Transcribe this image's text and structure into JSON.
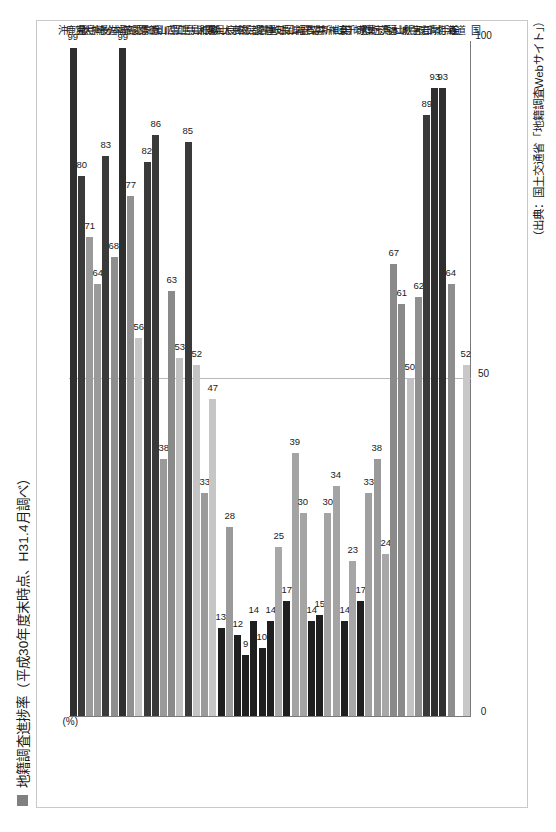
{
  "document": {
    "title": "地籍調査進捗率（平成30年度末時点、H31.4月調べ）",
    "legend_swatch_color": "#808080",
    "source_note": "（出典：国土交通省「地籍調査Webサイト」）"
  },
  "chart_data": {
    "type": "bar",
    "orientation": "horizontal",
    "title": "地籍調査進捗率（平成30年度末時点、H31.4月調べ）",
    "xlabel": "",
    "ylabel": "(%)",
    "unit_label": "(%)",
    "xlim": [
      0,
      100
    ],
    "ticks": [
      "0",
      "50",
      "100"
    ],
    "tick_values": [
      0,
      50,
      100
    ],
    "grid": true,
    "legend_position": "top-left",
    "legend": [
      "地籍調査進捗率"
    ],
    "categories": [
      "全　国",
      "北海道",
      "青　森",
      "岩　手",
      "宮　城",
      "秋　田",
      "山　形",
      "福　島",
      "茨　城",
      "栃　木",
      "群　馬",
      "埼　玉",
      "千　葉",
      "東　京",
      "神奈川",
      "新　潟",
      "富　山",
      "石　川",
      "福　井",
      "山　梨",
      "長　野",
      "岐　阜",
      "静　岡",
      "愛　知",
      "三　重",
      "滋　賀",
      "京　都",
      "大　阪",
      "兵　庫",
      "奈　良",
      "和歌山",
      "鳥　取",
      "島　根",
      "岡　山",
      "広　島",
      "山　口",
      "徳　島",
      "香　川",
      "愛　媛",
      "高　知",
      "福　岡",
      "佐　賀",
      "長　崎",
      "熊　本",
      "大　分",
      "宮　崎",
      "鹿児島",
      "沖　縄"
    ],
    "values": [
      52,
      64,
      93,
      93,
      89,
      62,
      50,
      61,
      67,
      24,
      38,
      33,
      17,
      23,
      14,
      34,
      30,
      15,
      14,
      30,
      39,
      17,
      25,
      14,
      10,
      14,
      9,
      12,
      28,
      13,
      47,
      33,
      52,
      85,
      53,
      63,
      38,
      86,
      82,
      56,
      77,
      99,
      68,
      83,
      64,
      71,
      80,
      99
    ],
    "bar_colors": [
      "#c8c8c8",
      "#8e8e8e",
      "#2f2f2f",
      "#2f2f2f",
      "#3a3a3a",
      "#909090",
      "#c2c2c2",
      "#8a8a8a",
      "#8a8a8a",
      "#a8a8a8",
      "#9a9a9a",
      "#a0a0a0",
      "#1f1f1f",
      "#a6a6a6",
      "#1f1f1f",
      "#a4a4a4",
      "#a4a4a4",
      "#1f1f1f",
      "#1f1f1f",
      "#a4a4a4",
      "#a4a4a4",
      "#1f1f1f",
      "#a8a8a8",
      "#1f1f1f",
      "#1f1f1f",
      "#1f1f1f",
      "#1f1f1f",
      "#1f1f1f",
      "#9a9a9a",
      "#1f1f1f",
      "#c6c6c6",
      "#9a9a9a",
      "#c4c4c4",
      "#3a3a3a",
      "#c2c2c2",
      "#8a8a8a",
      "#9a9a9a",
      "#3a3a3a",
      "#3a3a3a",
      "#c6c6c6",
      "#909090",
      "#2f2f2f",
      "#8e8e8e",
      "#3a3a3a",
      "#9a9a9a",
      "#9a9a9a",
      "#3a3a3a",
      "#2f2f2f"
    ]
  }
}
